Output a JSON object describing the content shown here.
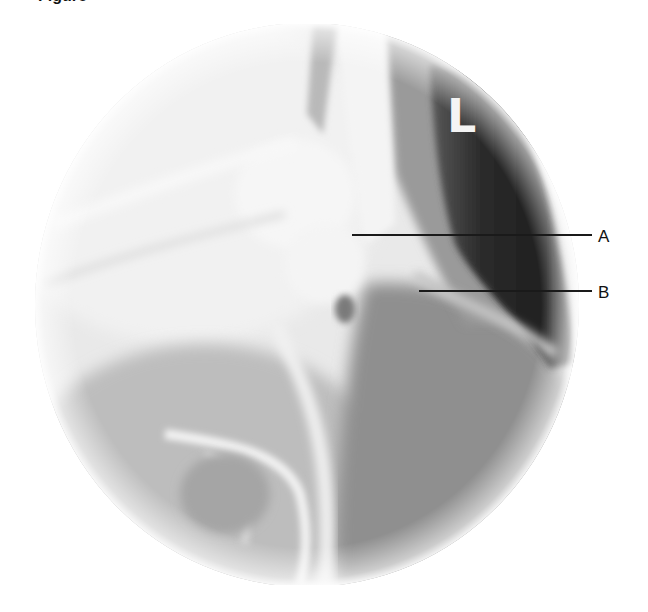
{
  "figure": {
    "caption_fragment": "Figure",
    "image_type": "circular radiograph (fluoroscopic view)",
    "side_marker": "L",
    "annotations": [
      {
        "label": "A",
        "line_start": [
          352,
          235
        ],
        "line_end": [
          592,
          235
        ],
        "label_pos": [
          598,
          228
        ]
      },
      {
        "label": "B",
        "line_start": [
          419,
          291
        ],
        "line_end": [
          592,
          291
        ],
        "label_pos": [
          598,
          284
        ]
      }
    ],
    "colors": {
      "background": "#ffffff",
      "bone_bright": "#f2f2f2",
      "soft_tissue": "#9a9a9a",
      "air_dark": "#2a2a2a",
      "annotation_line": "#1a1a1a"
    }
  }
}
